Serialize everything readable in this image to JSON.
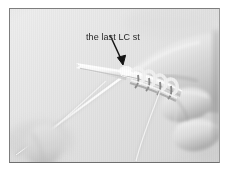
{
  "figure": {
    "kind": "photograph",
    "color_mode": "grayscale",
    "annotation": {
      "label_text": "the last LC st",
      "pointer": "arrow",
      "pointer_direction": "down-right",
      "points_to": "needle tip holding the last stitch"
    },
    "frame": {
      "border_color": "#8a8a8a",
      "background_color": "#e4e4e4",
      "page_color": "#ffffff"
    },
    "palette": {
      "background": "#e3e3e3",
      "skin_light": "#f0f0f0",
      "skin_shadow": "#b9b9b9",
      "needle": "#fbfbfb",
      "yarn": "#f5f5f5",
      "stitch_shadow": "#6d6d6d",
      "ink": "#1c1c1c"
    },
    "elements": [
      {
        "name": "left-needle",
        "description": "white tapered knitting needle entering from upper-left center"
      },
      {
        "name": "right-needle",
        "description": "knitting needle held in right hand carrying stitches"
      },
      {
        "name": "stitches",
        "description": "row of yarn loops on the needle"
      },
      {
        "name": "working-yarn",
        "description": "pale yarn strand running down to lower-left"
      },
      {
        "name": "hanging-yarn",
        "description": "yarn tail dropping toward bottom-right"
      },
      {
        "name": "right-hand",
        "description": "hand and fingers gripping the needle at right"
      },
      {
        "name": "left-thumb",
        "description": "blurred thumb at lower-left corner"
      }
    ]
  }
}
